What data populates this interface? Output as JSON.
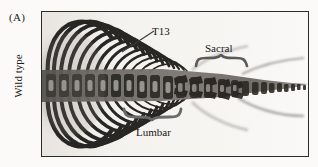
{
  "figure": {
    "panel_letter": "(A)",
    "row_label": "Wild type"
  },
  "annotations": {
    "t13": {
      "label": "T13",
      "icon": "leader-line-icon"
    },
    "sacral": {
      "label": "Sacral",
      "icon": "curly-brace-down-icon"
    },
    "lumbar": {
      "label": "Lumbar",
      "icon": "curly-brace-up-icon"
    }
  },
  "image": {
    "subject": "mouse-skeleton-radiograph",
    "background_color": "#f2f0ec",
    "bone_color": "#1d1d1d",
    "border_color": "#2b2b2b",
    "page_color": "#fbfaf8"
  }
}
